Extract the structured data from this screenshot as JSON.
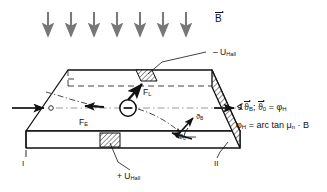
{
  "figure": {
    "colors": {
      "ink": "#111111",
      "arrow_gray": "#6e6e6e",
      "hatch": "#2b2b2b",
      "background": "#ffffff"
    },
    "field": {
      "label": "B",
      "arrow_count": 7,
      "direction": "down",
      "arrow_x_positions": [
        48,
        71,
        94,
        117,
        140,
        163,
        186
      ],
      "arrow_y_top": 12,
      "arrow_y_bottom": 40
    },
    "labels": {
      "b_field": "B",
      "u_hall_top": "– U",
      "u_hall_top_sub": "Hall",
      "u_hall_bottom": "+ U",
      "u_hall_bottom_sub": "Hall",
      "force_lorentz": "F",
      "force_lorentz_sub": "L",
      "force_electric": "F",
      "force_electric_sub": "E",
      "current_density": "J",
      "contact_left": "I",
      "contact_right": "II",
      "angle_b": "ϑ",
      "angle_b_sub": "B",
      "angle_0": "ϑ",
      "angle_0_sub": "0",
      "charge_sign": "−"
    },
    "formulas": {
      "line1_prefix": "∢",
      "line1_v1": "ϑ",
      "line1_v1_sub": "B",
      "line1_sep": ";",
      "line1_v2": "ϑ",
      "line1_v2_sub": "0",
      "line1_eq": "=",
      "line1_rhs": "φ",
      "line1_rhs_sub": "H",
      "line2_lhs": "φ",
      "line2_lhs_sub": "H",
      "line2_eq": "=",
      "line2_body": "arc tan μ",
      "line2_body_sub": "n",
      "line2_tail": "· B"
    }
  }
}
